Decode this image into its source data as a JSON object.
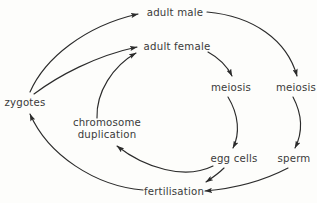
{
  "canvas": {
    "width": 317,
    "height": 203,
    "background": "#fdfdfb",
    "ink": "#2b2b2b",
    "text_color": "#3a3a3a"
  },
  "diagram": {
    "type": "cycle-diagram",
    "nodes": [
      {
        "id": "adult_male",
        "label": "adult male",
        "x": 175,
        "y": 13,
        "lines": 1
      },
      {
        "id": "adult_female",
        "label": "adult female",
        "x": 177,
        "y": 47,
        "lines": 1
      },
      {
        "id": "meiosis_f",
        "label": "meiosis",
        "x": 231,
        "y": 88,
        "lines": 1
      },
      {
        "id": "meiosis_m",
        "label": "meiosis",
        "x": 296,
        "y": 88,
        "lines": 1
      },
      {
        "id": "zygotes",
        "label": "zygotes",
        "x": 25,
        "y": 103,
        "lines": 1
      },
      {
        "id": "chromosome",
        "label": "chromosome\nduplication",
        "x": 107,
        "y": 129,
        "lines": 2
      },
      {
        "id": "egg_cells",
        "label": "egg cells",
        "x": 234,
        "y": 159,
        "lines": 1
      },
      {
        "id": "sperm",
        "label": "sperm",
        "x": 294,
        "y": 159,
        "lines": 1
      },
      {
        "id": "fertilisation",
        "label": "fertilisation",
        "x": 174,
        "y": 192,
        "lines": 1
      }
    ],
    "edges": [
      {
        "id": "zygotes-to-adult-male",
        "from": "zygotes",
        "to": "adult_male",
        "d": "M 30 92 C 45 58, 85 26, 138 14"
      },
      {
        "id": "zygotes-to-adult-female",
        "from": "zygotes",
        "to": "adult_female",
        "d": "M 34 94 C 58 76, 95 56, 137 47"
      },
      {
        "id": "chromosome-to-adult-female",
        "from": "chromosome",
        "to": "adult_female",
        "d": "M 97 118 C 96 92, 113 66, 136 53"
      },
      {
        "id": "adult-male-to-meiosis-male",
        "from": "adult_male",
        "to": "meiosis_m",
        "d": "M 207 12 C 253 16, 287 40, 297 76"
      },
      {
        "id": "adult-female-to-meiosis-female",
        "from": "adult_female",
        "to": "meiosis_f",
        "d": "M 208 52 C 219 58, 227 66, 232 76"
      },
      {
        "id": "meiosis-female-to-egg-cells",
        "from": "meiosis_f",
        "to": "egg_cells",
        "d": "M 228 97 C 239 115, 240 134, 233 148"
      },
      {
        "id": "meiosis-male-to-sperm",
        "from": "meiosis_m",
        "to": "sperm",
        "d": "M 293 97 C 303 116, 302 134, 295 148"
      },
      {
        "id": "egg-cells-to-fertilisation",
        "from": "egg_cells",
        "to": "fertilisation",
        "d": "M 224 168 C 218 174, 212 178, 206 182"
      },
      {
        "id": "sperm-to-fertilisation",
        "from": "sperm",
        "to": "fertilisation",
        "d": "M 288 168 C 265 180, 240 188, 205 191"
      },
      {
        "id": "fertilisation-to-zygotes",
        "from": "fertilisation",
        "to": "zygotes",
        "d": "M 143 190 C 95 186, 48 155, 30 114"
      },
      {
        "id": "egg-cells-to-chromosome",
        "from": "egg_cells",
        "to": "chromosome",
        "d": "M 213 166 C 185 180, 145 168, 117 146"
      }
    ],
    "arrowhead": {
      "id": "arrow-marker",
      "shape": "solid-triangle",
      "width": 7.5,
      "height": 5.2
    }
  }
}
